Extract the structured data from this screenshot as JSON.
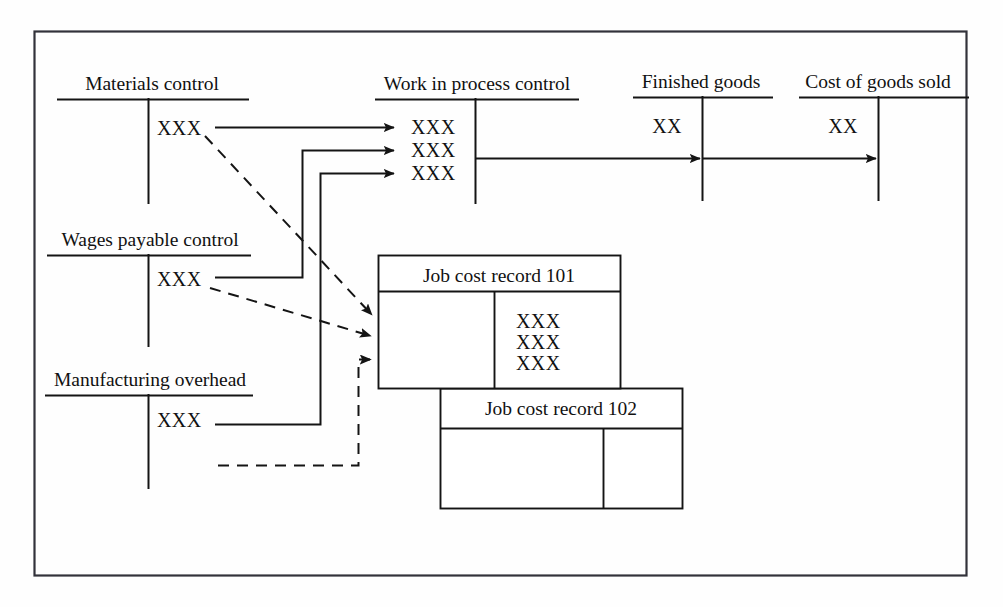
{
  "diagram": {
    "title_text": "",
    "canvas": {
      "width": 1003,
      "height": 607
    },
    "colors": {
      "ink": "#141414",
      "frame": "#32323a",
      "paper": "#fefefe"
    }
  },
  "t_accounts": [
    {
      "id": "materials-control",
      "label": "Materials control",
      "entries": [
        "XXX"
      ]
    },
    {
      "id": "wages-payable-control",
      "label": "Wages payable control",
      "entries": [
        "XXX"
      ]
    },
    {
      "id": "manufacturing-overhead",
      "label": "Manufacturing overhead",
      "entries": [
        "XXX"
      ]
    },
    {
      "id": "work-in-process-control",
      "label": "Work in process control",
      "entries": [
        "XXX",
        "XXX",
        "XXX"
      ]
    },
    {
      "id": "finished-goods",
      "label": "Finished goods",
      "entries": [
        "XX"
      ]
    },
    {
      "id": "cost-of-goods-sold",
      "label": "Cost of goods sold",
      "entries": [
        "XX"
      ]
    }
  ],
  "job_cost_records": [
    {
      "id": "job-cost-record-101",
      "title": "Job cost record 101",
      "right_column_entries": [
        "XXX",
        "XXX",
        "XXX"
      ],
      "left_column_entries": []
    },
    {
      "id": "job-cost-record-102",
      "title": "Job cost record 102",
      "right_column_entries": [],
      "left_column_entries": []
    }
  ],
  "flows": {
    "solid": [
      {
        "id": "materials-to-wip",
        "from": "materials-control",
        "to": "work-in-process-control",
        "style": "solid"
      },
      {
        "id": "wages-to-wip",
        "from": "wages-payable-control",
        "to": "work-in-process-control",
        "style": "solid"
      },
      {
        "id": "overhead-to-wip",
        "from": "manufacturing-overhead",
        "to": "work-in-process-control",
        "style": "solid"
      },
      {
        "id": "wip-to-finished-goods",
        "from": "work-in-process-control",
        "to": "finished-goods",
        "style": "solid"
      },
      {
        "id": "finished-goods-to-cogs",
        "from": "finished-goods",
        "to": "cost-of-goods-sold",
        "style": "solid"
      }
    ],
    "dashed": [
      {
        "id": "materials-to-job101",
        "from": "materials-control",
        "to": "job-cost-record-101",
        "style": "dashed"
      },
      {
        "id": "wages-to-job101",
        "from": "wages-payable-control",
        "to": "job-cost-record-101",
        "style": "dashed"
      },
      {
        "id": "overhead-to-job101",
        "from": "manufacturing-overhead",
        "to": "job-cost-record-101",
        "style": "dashed"
      }
    ]
  }
}
